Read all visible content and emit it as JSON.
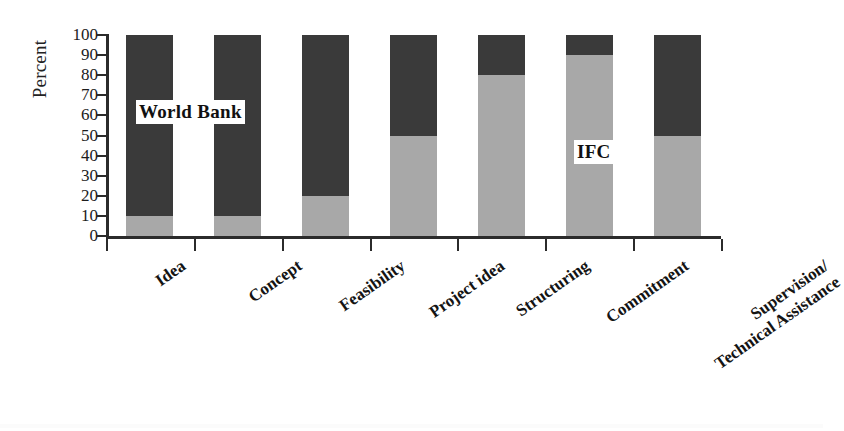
{
  "chart_data": {
    "type": "bar",
    "subtype": "stacked-percentage",
    "title": "",
    "xlabel": "",
    "ylabel": "Percent",
    "ylim": [
      0,
      100
    ],
    "yticks": [
      0,
      10,
      20,
      30,
      40,
      50,
      60,
      70,
      80,
      90,
      100
    ],
    "ytick_labels": [
      "0",
      "10",
      "20",
      "30",
      "40",
      "50",
      "60",
      "70",
      "80",
      "90",
      "100"
    ],
    "grid": false,
    "legend": "in-plot annotations",
    "categories": [
      "Idea",
      "Concept",
      "Feasibility",
      "Project idea",
      "Structuring",
      "Commitment",
      "Supervision/ Technical Assistance"
    ],
    "category_lines": [
      [
        "Idea"
      ],
      [
        "Concept"
      ],
      [
        "Feasibility"
      ],
      [
        "Project idea"
      ],
      [
        "Structuring"
      ],
      [
        "Commitment"
      ],
      [
        "Supervision/",
        "Technical Assistance"
      ]
    ],
    "series": [
      {
        "name": "IFC",
        "color": "#a8a8a8",
        "values": [
          10,
          10,
          20,
          50,
          80,
          90,
          50
        ]
      },
      {
        "name": "World Bank",
        "color": "#3a3a3a",
        "values": [
          90,
          90,
          80,
          50,
          20,
          10,
          50
        ]
      }
    ],
    "annotations": [
      {
        "text": "World Bank",
        "series": "World Bank"
      },
      {
        "text": "IFC",
        "series": "IFC"
      }
    ]
  },
  "axis": {
    "y_title": "Percent"
  }
}
